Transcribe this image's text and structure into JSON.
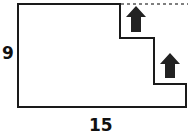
{
  "diagram": {
    "type": "rectilinear-shape",
    "labels": {
      "height": "9",
      "width": "15"
    },
    "elements": [
      {
        "name": "outline",
        "style": "solid"
      },
      {
        "name": "dashed-top-extension",
        "style": "dashed"
      },
      {
        "name": "arrow-up-upper",
        "direction": "up"
      },
      {
        "name": "arrow-up-lower",
        "direction": "up"
      }
    ],
    "colors": {
      "line": "#1a1a1a",
      "arrow": "#222222",
      "dashed": "#555555"
    }
  }
}
